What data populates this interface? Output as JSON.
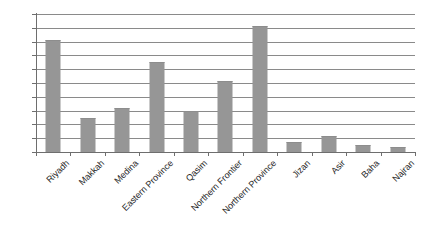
{
  "chart_data": {
    "type": "bar",
    "title": "",
    "xlabel": "",
    "ylabel": "",
    "ylim": [
      0.0,
      50.0
    ],
    "ytick_step": 5.0,
    "grid": true,
    "legend": false,
    "orientation": "vertical",
    "bar_color": "#969696",
    "axis_color": "#6e6e6e",
    "gridline_color": "#8a8a8a",
    "categories": [
      "Riyadh",
      "Makkah",
      "Medina",
      "Eastern Province",
      "Qasim",
      "Northern Frontier",
      "Northern Province",
      "Jizan",
      "Asir",
      "Baha",
      "Najran"
    ],
    "values": [
      40.5,
      12.3,
      16.0,
      32.5,
      14.8,
      25.8,
      45.8,
      3.8,
      5.8,
      2.5,
      1.8
    ],
    "ytick_labels": [
      "50.0",
      "45.0",
      "40.0",
      "35.0",
      "30.0",
      "25.0",
      "20.0",
      "15.0",
      "10.0",
      "5.0",
      "0.0"
    ],
    "ytick_values": [
      50.0,
      45.0,
      40.0,
      35.0,
      30.0,
      25.0,
      20.0,
      15.0,
      10.0,
      5.0,
      0.0
    ]
  }
}
